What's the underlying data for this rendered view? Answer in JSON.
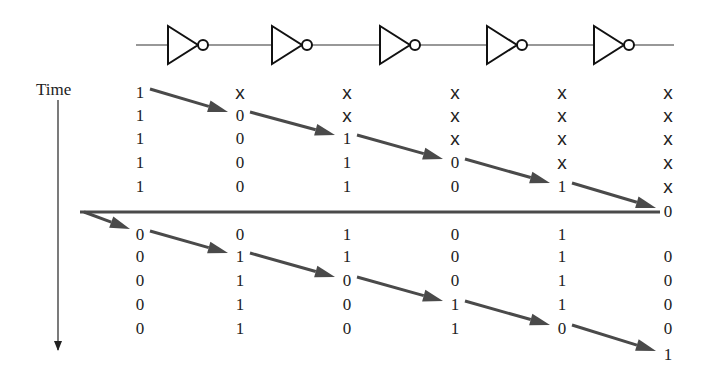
{
  "time_label": "Time",
  "circuit": {
    "inverter_count": 5,
    "inverter_x": [
      190,
      294,
      402,
      509,
      616
    ],
    "wire_y": 45,
    "wire_x_start": 136,
    "wire_x_end": 674
  },
  "colors": {
    "ink": "#222222",
    "arrow": "#4a4a4a",
    "background": "#ffffff"
  },
  "columns_x": [
    140,
    240,
    347,
    455,
    562,
    668
  ],
  "top_rows_y": [
    92,
    115,
    138,
    162,
    186
  ],
  "top_block": [
    [
      "1",
      "X",
      "X",
      "X",
      "X",
      "X"
    ],
    [
      "1",
      "0",
      "X",
      "X",
      "X",
      "X"
    ],
    [
      "1",
      "0",
      "1",
      "X",
      "X",
      "X"
    ],
    [
      "1",
      "0",
      "1",
      "0",
      "X",
      "X"
    ],
    [
      "1",
      "0",
      "1",
      "0",
      "1",
      "X"
    ]
  ],
  "feedback_value": {
    "text": "0",
    "x": 668,
    "y": 211
  },
  "feedback_line": {
    "y": 212,
    "x_start": 80,
    "x_end": 660
  },
  "bottom_rows_y": [
    234,
    256,
    280,
    304,
    328
  ],
  "bottom_block": [
    [
      "0",
      "0",
      "1",
      "0",
      "1",
      ""
    ],
    [
      "0",
      "1",
      "1",
      "0",
      "1",
      "0"
    ],
    [
      "0",
      "1",
      "0",
      "0",
      "1",
      "0"
    ],
    [
      "0",
      "1",
      "0",
      "1",
      "1",
      "0"
    ],
    [
      "0",
      "1",
      "0",
      "1",
      "0",
      "0"
    ]
  ],
  "final_value": {
    "text": "1",
    "x": 668,
    "y": 354
  },
  "time_axis": {
    "x": 58,
    "y_start": 100,
    "y_end": 350
  }
}
